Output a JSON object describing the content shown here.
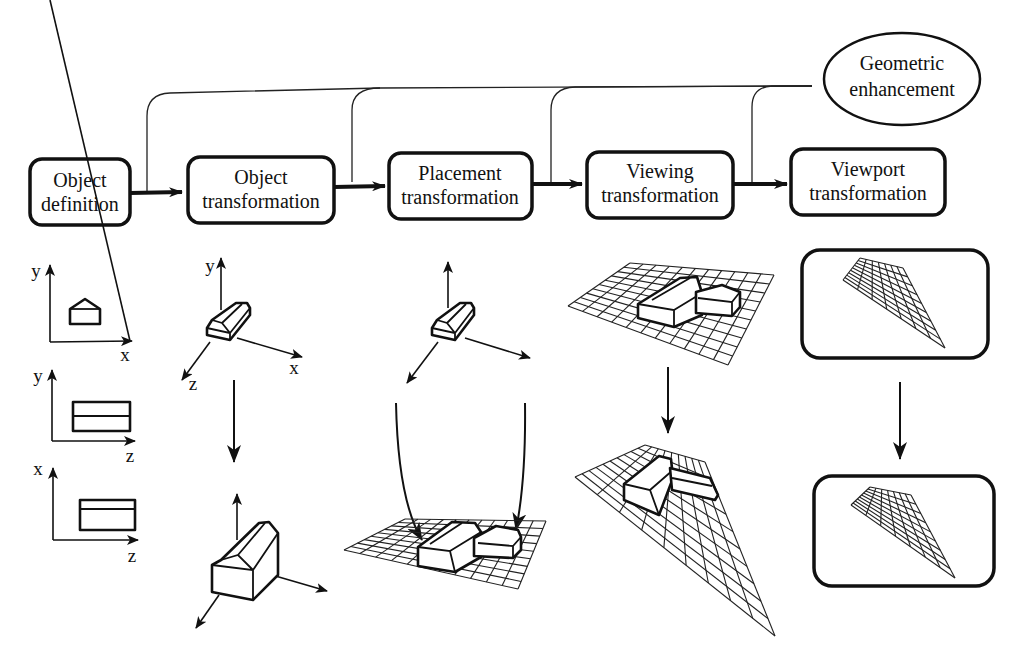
{
  "diagram": {
    "title": "",
    "pipeline": [
      {
        "id": "object-definition",
        "line1": "Object",
        "line2": "definition"
      },
      {
        "id": "object-transformation",
        "line1": "Object",
        "line2": "transformation"
      },
      {
        "id": "placement-transformation",
        "line1": "Placement",
        "line2": "transformation"
      },
      {
        "id": "viewing-transformation",
        "line1": "Viewing",
        "line2": "transformation"
      },
      {
        "id": "viewport-transformation",
        "line1": "Viewport",
        "line2": "transformation"
      }
    ],
    "enhancement": {
      "line1": "Geometric",
      "line2": "enhancement"
    },
    "feedback_description": "Geometric enhancement feeds into the arrows between every pipeline stage",
    "illustrations": {
      "object_definition_views": [
        {
          "vertical_axis": "y",
          "horizontal_axis": "x",
          "view": "front"
        },
        {
          "vertical_axis": "y",
          "horizontal_axis": "z",
          "view": "side"
        },
        {
          "vertical_axis": "x",
          "horizontal_axis": "z",
          "view": "top"
        }
      ],
      "object_transformation_axes": {
        "y": "y",
        "x": "x",
        "z": "z"
      },
      "descriptions": [
        "Three orthographic views of a house-shaped object",
        "Object in its own 3D coordinate system, then scaled",
        "Objects placed onto a ground grid (world coordinates)",
        "Scene viewed in perspective",
        "Scene mapped to screen viewport windows"
      ]
    }
  }
}
